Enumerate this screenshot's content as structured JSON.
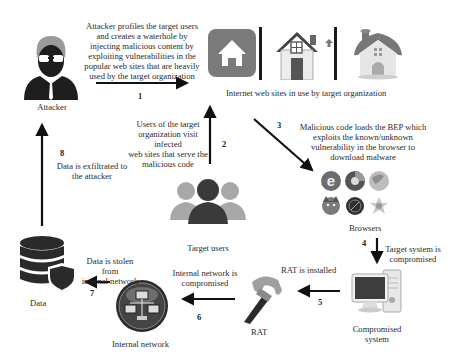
{
  "nodes": {
    "attacker": {
      "label": "Attacker",
      "icon": "attacker-icon"
    },
    "websites": {
      "label": "Internet web sites in use by target organization",
      "icons": [
        "home-app-icon",
        "house-icon",
        "cottage-icon"
      ]
    },
    "target_users": {
      "label": "Target users",
      "icon": "users-group-icon"
    },
    "browsers": {
      "label": "Browsers",
      "icons": [
        "internet-explorer-icon",
        "chrome-icon",
        "safari-icon",
        "firefox-icon",
        "opera-icon",
        "maxthon-icon"
      ]
    },
    "compromised_system": {
      "label": "Compromised\nsystem",
      "label_line1": "Compromised",
      "label_line2": "system",
      "icon": "desktop-computer-icon"
    },
    "rat": {
      "label": "RAT",
      "icon": "hammer-icon"
    },
    "internal_network": {
      "label": "Internal network",
      "icon": "network-icon"
    },
    "data": {
      "label": "Data",
      "icon": "database-shield-icon"
    }
  },
  "steps": [
    {
      "number": "1",
      "text": "Attacker profiles the target users and creates a waterhole by injecting malicious content by exploiting vulnerabilities in the popular web sites that are heavily used by the target organization",
      "lines": [
        "Attacker profiles the target users",
        "and creates a waterhole by",
        "injecting malicious content by",
        "exploiting vulnerabilities in the",
        "popular web sites that are heavily",
        "used by the target organization"
      ]
    },
    {
      "number": "2",
      "text": "Users of the target organization visit infected web sites that serve the malicious code",
      "lines": [
        "Users of the target",
        "organization visit infected",
        "web sites that serve the",
        "malicious code"
      ]
    },
    {
      "number": "3",
      "text": "Malicious code loads the BEP which exploits the known/unknown vulnerability in the browser to download malware",
      "lines": [
        "Malicious code loads the BEP which",
        "exploits the known/unknown",
        "vulnerability in the browser to",
        "download malware"
      ]
    },
    {
      "number": "4",
      "text": "Target system is compromised",
      "lines": [
        "Target system is",
        "compromised"
      ]
    },
    {
      "number": "5",
      "text": "RAT is installed",
      "lines": [
        "RAT is installed"
      ]
    },
    {
      "number": "6",
      "text": "Internal network is compromised",
      "lines": [
        "Internal network is",
        "compromised"
      ]
    },
    {
      "number": "7",
      "text": "Data is stolen from internal network",
      "lines": [
        "Data is stolen from",
        "internal network"
      ]
    },
    {
      "number": "8",
      "text": "Data is exfiltrated to the attacker",
      "lines": [
        "Data is exfiltrated to",
        "the attacker"
      ]
    }
  ],
  "colors": {
    "arrow": "#111111",
    "text": "#2a2a2a",
    "icon_dark": "#1e1e1e",
    "icon_gray": "#8a8a8a"
  }
}
